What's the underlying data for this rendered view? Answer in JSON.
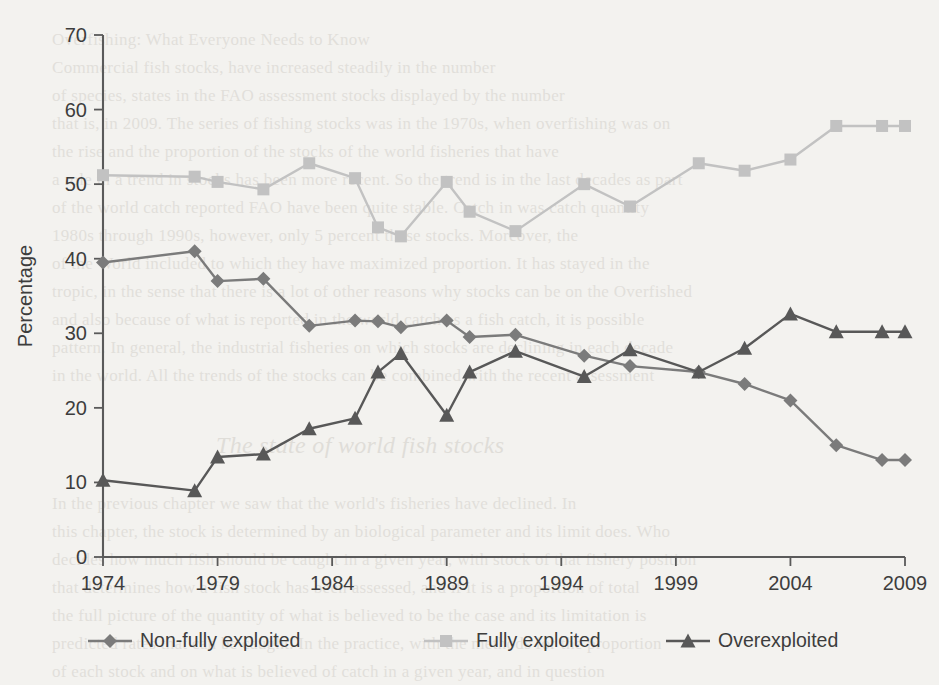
{
  "chart_data": {
    "type": "line",
    "title": "",
    "xlabel": "",
    "ylabel": "Percentage",
    "xlim": [
      1974,
      2009
    ],
    "ylim": [
      0,
      70
    ],
    "yticks": [
      0,
      10,
      20,
      30,
      40,
      50,
      60,
      70
    ],
    "xticks": [
      1974,
      1979,
      1984,
      1989,
      1994,
      1999,
      2004,
      2009
    ],
    "xtick_labels": [
      "1974",
      "1979",
      "1984",
      "1989",
      "1994",
      "1999",
      "2004",
      "2009"
    ],
    "ytick_labels": [
      "0",
      "10",
      "20",
      "30",
      "40",
      "50",
      "60",
      "70"
    ],
    "grid": false,
    "legend_position": "bottom",
    "x": [
      1974,
      1978,
      1979,
      1981,
      1983,
      1985,
      1986,
      1987,
      1989,
      1990,
      1992,
      1995,
      1997,
      2000,
      2002,
      2004,
      2006,
      2008,
      2009
    ],
    "series": [
      {
        "name": "Non-fully exploited",
        "marker": "diamond",
        "color": "#7b7b7b",
        "values": [
          39.5,
          41.0,
          37.0,
          37.3,
          31.0,
          31.7,
          31.6,
          30.8,
          31.7,
          29.5,
          29.8,
          27.0,
          25.6,
          24.8,
          23.2,
          21.0,
          15.0,
          13.0,
          13.0
        ]
      },
      {
        "name": "Fully exploited",
        "marker": "square",
        "color": "#c2c2c2",
        "values": [
          51.2,
          51.0,
          50.3,
          49.3,
          52.8,
          50.8,
          44.2,
          43.0,
          50.3,
          46.3,
          43.7,
          50.0,
          47.0,
          52.8,
          51.8,
          53.3,
          57.8,
          57.8,
          57.8
        ]
      },
      {
        "name": "Overexploited",
        "marker": "triangle",
        "color": "#585858",
        "values": [
          10.3,
          8.9,
          13.4,
          13.8,
          17.2,
          18.6,
          24.8,
          27.3,
          19.0,
          24.8,
          27.6,
          24.2,
          27.8,
          24.8,
          28.0,
          32.6,
          30.2,
          30.2,
          30.2
        ]
      }
    ]
  },
  "axes": {
    "y_title": "Percentage"
  },
  "legend": {
    "items": [
      {
        "label": "Non-fully exploited",
        "marker": "diamond",
        "color": "#7b7b7b"
      },
      {
        "label": "Fully exploited",
        "marker": "square",
        "color": "#c2c2c2"
      },
      {
        "label": "Overexploited",
        "marker": "triangle",
        "color": "#585858"
      }
    ]
  },
  "background_text": {
    "lines": [
      {
        "x": 52,
        "y": 30,
        "size": 17,
        "text": "Overfishing: What Everyone Needs to Know"
      },
      {
        "x": 52,
        "y": 58,
        "size": 17,
        "text": "Commercial fish stocks, have increased steadily in the number"
      },
      {
        "x": 52,
        "y": 86,
        "size": 17,
        "text": "of species, states in the FAO assessment stocks displayed by the number"
      },
      {
        "x": 52,
        "y": 114,
        "size": 17,
        "text": "that is, in 2009. The series of fishing stocks was in the 1970s, when overfishing was on"
      },
      {
        "x": 52,
        "y": 142,
        "size": 17,
        "text": "the rise and the proportion of the stocks of the world fisheries that have"
      },
      {
        "x": 52,
        "y": 170,
        "size": 17,
        "text": "a role in a trend in stocks has been more recent. So the trend is in the last decades as part"
      },
      {
        "x": 52,
        "y": 198,
        "size": 17,
        "text": "of the world catch reported FAO have been quite stable. Catch in was catch quantity"
      },
      {
        "x": 52,
        "y": 226,
        "size": 17,
        "text": "1980s through 1990s, however, only 5 percent these stocks. Moreover, the"
      },
      {
        "x": 52,
        "y": 254,
        "size": 17,
        "text": "of the World included to which they have maximized proportion. It has stayed in the"
      },
      {
        "x": 52,
        "y": 282,
        "size": 17,
        "text": "tropic, in the sense that there is a lot of other reasons why stocks can be on the Overfished"
      },
      {
        "x": 52,
        "y": 310,
        "size": 17,
        "text": "and also because of what is reported in the world catch as a fish catch, it is possible"
      },
      {
        "x": 52,
        "y": 338,
        "size": 17,
        "text": "pattern. In general, the industrial fisheries on which stocks are declining in each decade"
      },
      {
        "x": 52,
        "y": 366,
        "size": 17,
        "text": "in the world. All the trends of the stocks can be combined with the recent assessment"
      },
      {
        "x": 216,
        "y": 432,
        "size": 24,
        "text": "The state of world fish stocks",
        "head": true
      },
      {
        "x": 52,
        "y": 494,
        "size": 17,
        "text": "In the previous chapter we saw that the world's fisheries have declined. In"
      },
      {
        "x": 52,
        "y": 522,
        "size": 17,
        "text": "this chapter, the stock is determined by an biological parameter and its limit does. Who"
      },
      {
        "x": 52,
        "y": 550,
        "size": 17,
        "text": "decides how much fish should be caught in a given year, with stock of that fishery position"
      },
      {
        "x": 52,
        "y": 578,
        "size": 17,
        "text": "that determines how a fish stock has been assessed, and if it is a proportion of total"
      },
      {
        "x": 52,
        "y": 606,
        "size": 17,
        "text": "the full picture of the quantity of what is believed to be the case and its limitation is"
      },
      {
        "x": 52,
        "y": 634,
        "size": 17,
        "text": "predicted rates that can be caught. In the practice, with the methods for the proportion"
      },
      {
        "x": 52,
        "y": 662,
        "size": 17,
        "text": "of each stock and on what is believed of catch in a given year, and in question"
      }
    ]
  }
}
